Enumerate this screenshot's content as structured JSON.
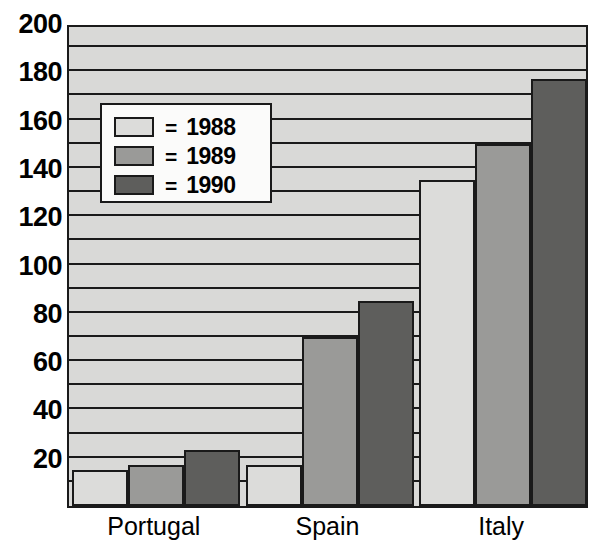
{
  "chart_data": {
    "type": "bar",
    "title": "",
    "xlabel": "",
    "ylabel": "",
    "categories": [
      "Portugal",
      "Spain",
      "Italy"
    ],
    "series": [
      {
        "name": "1988",
        "values": [
          15,
          17,
          135
        ],
        "color": "#dcdcda"
      },
      {
        "name": "1989",
        "values": [
          17,
          70,
          150
        ],
        "color": "#9a9a98"
      },
      {
        "name": "1990",
        "values": [
          23,
          85,
          177
        ],
        "color": "#5e5e5c"
      }
    ],
    "ylim": [
      0,
      200
    ],
    "y_tick_labels": [
      "200",
      "180",
      "160",
      "140",
      "120",
      "100",
      "80",
      "60",
      "40",
      "20"
    ],
    "y_tick_values": [
      200,
      180,
      160,
      140,
      120,
      100,
      80,
      60,
      40,
      20
    ],
    "y_major_step": 20,
    "y_gridline_step": 10,
    "grid": true,
    "legend_position": "upper-left-inside",
    "legend": {
      "entries": [
        {
          "equals": "=",
          "label": "1988",
          "swatch": "legend-swatch-1988"
        },
        {
          "equals": "=",
          "label": "1989",
          "swatch": "legend-swatch-1989"
        },
        {
          "equals": "=",
          "label": "1990",
          "swatch": "legend-swatch-1990"
        }
      ]
    },
    "colors": {
      "series_1988": "#dcdcda",
      "series_1989": "#9a9a98",
      "series_1990": "#5e5e5c",
      "plot_background": "#d9d9d7",
      "axis_line": "#1a1a1a",
      "legend_background": "#fbfbfa",
      "text": "#000000"
    }
  }
}
